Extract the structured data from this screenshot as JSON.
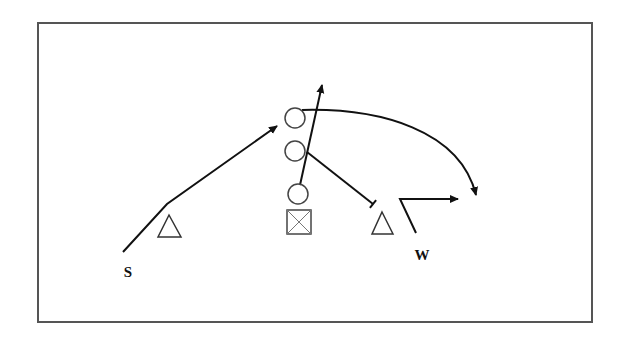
{
  "diagram": {
    "type": "football-play-diagram",
    "frame": {
      "x": 38,
      "y": 23,
      "width": 554,
      "height": 299,
      "stroke": "#555555"
    },
    "colors": {
      "ink": "#111111",
      "light_ink": "#777777",
      "frame": "#555555",
      "background": "#ffffff"
    },
    "labels": {
      "s": {
        "text": "S",
        "x": 128,
        "y": 272
      },
      "w": {
        "text": "W",
        "x": 422,
        "y": 255
      }
    },
    "offense": {
      "circles": [
        {
          "id": "offense-player-1",
          "cx": 295,
          "cy": 118,
          "r": 10
        },
        {
          "id": "offense-player-2",
          "cx": 295,
          "cy": 151,
          "r": 10
        },
        {
          "id": "offense-player-3",
          "cx": 298,
          "cy": 194,
          "r": 10
        }
      ],
      "center_box": {
        "x": 287,
        "y": 210,
        "size": 24
      }
    },
    "defense": {
      "triangles": [
        {
          "id": "defender-left",
          "apex": [
            169,
            215
          ],
          "base_left": [
            158,
            237
          ],
          "base_right": [
            181,
            237
          ]
        },
        {
          "id": "defender-right",
          "apex": [
            382,
            212
          ],
          "base_left": [
            372,
            234
          ],
          "base_right": [
            393,
            234
          ]
        }
      ]
    },
    "routes": [
      {
        "id": "s-route",
        "points": [
          [
            123,
            252
          ],
          [
            167,
            204
          ],
          [
            277,
            126
          ]
        ],
        "end": "arrow"
      },
      {
        "id": "vertical-route",
        "points": [
          [
            300,
            185
          ],
          [
            322,
            85
          ]
        ],
        "end": "arrow"
      },
      {
        "id": "curve-route",
        "path": "M 302 110 C 380 108, 460 130, 476 195",
        "end": "arrow"
      },
      {
        "id": "block-route",
        "points": [
          [
            307,
            152
          ],
          [
            373,
            204
          ]
        ],
        "end": "block"
      },
      {
        "id": "w-route",
        "points": [
          [
            416,
            233
          ],
          [
            400,
            199
          ],
          [
            458,
            199
          ]
        ],
        "end": "arrow"
      }
    ]
  }
}
